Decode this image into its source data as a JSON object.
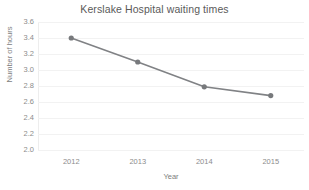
{
  "chart_data": {
    "type": "line",
    "title": "Kerslake Hospital waiting times",
    "xlabel": "Year",
    "ylabel": "Number of hours",
    "categories": [
      "2012",
      "2013",
      "2014",
      "2015"
    ],
    "values": [
      3.4,
      3.1,
      2.79,
      2.68
    ],
    "series": [
      {
        "name": "Waiting time",
        "values": [
          3.4,
          3.1,
          2.79,
          2.68
        ]
      }
    ],
    "ylim": [
      2.0,
      3.6
    ],
    "ytick_labels": [
      "3.6",
      "3.4",
      "3.2",
      "3.0",
      "2.8",
      "2.6",
      "2.4",
      "2.2",
      "2.0"
    ],
    "ytick_values": [
      3.6,
      3.4,
      3.2,
      3.0,
      2.8,
      2.6,
      2.4,
      2.2,
      2.0
    ],
    "grid": true,
    "legend": false,
    "colors": {
      "line": "#808285",
      "marker": "#77797c",
      "gridline": "#f2f2f2",
      "axis": "#ededed",
      "title_text": "#5a5a5a",
      "tick_text": "#8c8c8c",
      "axis_title_text": "#7d7d7d",
      "background": "#ffffff"
    }
  }
}
